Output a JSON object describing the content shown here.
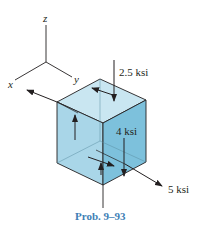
{
  "figure": {
    "caption": "Prob. 9–93",
    "caption_color": "#3f7fb5",
    "axes": {
      "z": "z",
      "x": "x",
      "y": "y"
    },
    "loads": {
      "normal_z": "2.5 ksi",
      "shear": "4 ksi",
      "normal_y": "5 ksi"
    },
    "colors": {
      "top_face": "#c9e6f1",
      "front_face": "#a9d6e8",
      "right_face": "#7dc1dc",
      "line": "#231f20"
    }
  }
}
